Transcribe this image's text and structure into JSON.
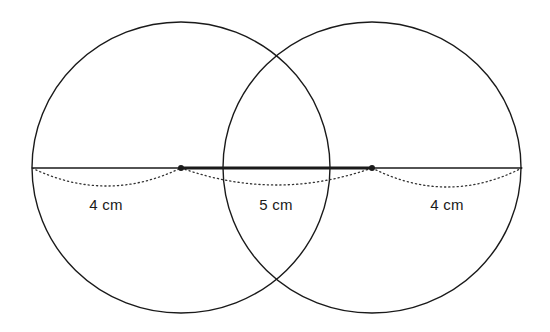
{
  "diagram": {
    "colors": {
      "stroke": "#1a1a1a",
      "background": "#ffffff"
    },
    "circles": [
      {
        "name": "left-circle",
        "cx": 181,
        "cy": 167.5,
        "rx": 149,
        "ry": 145.5
      },
      {
        "name": "right-circle",
        "cx": 372,
        "cy": 167.5,
        "rx": 149,
        "ry": 145.5
      }
    ],
    "centers": [
      {
        "name": "left-center-point",
        "x": 181,
        "y": 168
      },
      {
        "name": "right-center-point",
        "x": 372,
        "y": 168
      }
    ],
    "segments": [
      {
        "name": "left-radius-line",
        "x1": 32,
        "x2": 181,
        "y": 168,
        "weight": "thin"
      },
      {
        "name": "center-to-center-line",
        "x1": 181,
        "x2": 372,
        "y": 168,
        "weight": "thick"
      },
      {
        "name": "right-radius-line",
        "x1": 372,
        "x2": 522,
        "y": 168,
        "weight": "thin"
      }
    ],
    "dotted_arcs": [
      {
        "name": "left-dimension-arc",
        "x1": 32,
        "x2": 181,
        "y": 168,
        "depth": 18
      },
      {
        "name": "middle-dimension-arc",
        "x1": 181,
        "x2": 372,
        "y": 168,
        "depth": 17
      },
      {
        "name": "right-dimension-arc",
        "x1": 372,
        "x2": 522,
        "y": 168,
        "depth": 19
      }
    ],
    "labels": [
      {
        "name": "left-measure-label",
        "text": "4 cm",
        "x": 106,
        "y": 204
      },
      {
        "name": "middle-measure-label",
        "text": "5 cm",
        "x": 276,
        "y": 204
      },
      {
        "name": "right-measure-label",
        "text": "4 cm",
        "x": 447,
        "y": 204
      }
    ]
  }
}
